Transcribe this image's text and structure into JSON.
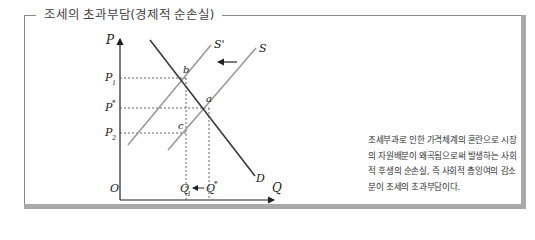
{
  "title": "조세의 초과부담(경제적 순손실)",
  "description": "조세부과로 인한 가격체계의 혼란으로 시장의 자원배분이 왜곡됨으로써 발생하는 사회적 후생의 순손실, 즉 사회적 총잉여의 감소분이 조세의 초과부담이다.",
  "axes": {
    "y_label": "P",
    "x_label": "Q",
    "origin": "O"
  },
  "price_labels": {
    "p1": "P",
    "p1_sub": "1",
    "pstar": "P",
    "pstar_sup": "*",
    "p2": "P",
    "p2_sub": "2"
  },
  "quantity_labels": {
    "q1": "Q",
    "q1_sub": "1",
    "qstar": "Q",
    "qstar_sup": "*"
  },
  "curves": {
    "demand": "D",
    "supply": "S",
    "supply_shifted": "S'"
  },
  "points": {
    "a": "a",
    "b": "b",
    "c": "c"
  },
  "colors": {
    "demand": "#3a3a3a",
    "supply": "#9a9a9a",
    "axis": "#222222",
    "frame": "#a9a9a9"
  }
}
